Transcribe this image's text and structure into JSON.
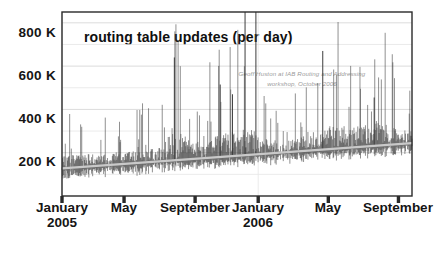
{
  "chart_data": {
    "type": "line",
    "render_style": "daily-spikes",
    "title": "routing table updates (per day)",
    "annotation": "Geoff Huston at IAB Routing and Addressing workshop, October 2006",
    "annotation_lines": [
      "Geoff Huston at IAB Routing and Addressing",
      "workshop, October 2006"
    ],
    "xlabel": "",
    "ylabel": "",
    "ylim": [
      0,
      850
    ],
    "y_unit": "K",
    "yticks": [
      200,
      400,
      600,
      800
    ],
    "ytick_labels": [
      "200 K",
      "400 K",
      "600 K",
      "800 K"
    ],
    "minor_gridlines": [
      100,
      300,
      500,
      700
    ],
    "grid": true,
    "legend": "none",
    "xlim_dates": [
      "2005-01-01",
      "2006-10-15"
    ],
    "xticks": [
      {
        "label": "January",
        "sublabel": "2005",
        "pos": 0.0
      },
      {
        "label": "May",
        "sublabel": "",
        "pos": 0.1773
      },
      {
        "label": "September",
        "sublabel": "",
        "pos": 0.3803
      },
      {
        "label": "January",
        "sublabel": "2006",
        "pos": 0.5606
      },
      {
        "label": "May",
        "sublabel": "",
        "pos": 0.7609
      },
      {
        "label": "September",
        "sublabel": "",
        "pos": 0.9613
      }
    ],
    "trend_line": {
      "description": "rising linear trend through the daily baseline",
      "start_value": 128,
      "end_value": 244,
      "color": "#c9c9c9"
    },
    "series_color": "#3c3c3c",
    "notable_spikes": [
      {
        "pos": 0.321,
        "value": 640
      },
      {
        "pos": 0.452,
        "value": 515
      },
      {
        "pos": 0.487,
        "value": 470
      },
      {
        "pos": 0.523,
        "value": 850
      },
      {
        "pos": 0.554,
        "value": 850
      },
      {
        "pos": 0.745,
        "value": 670
      },
      {
        "pos": 0.892,
        "value": 455
      }
    ],
    "baseline_range": [
      95,
      250
    ],
    "axis_color": "#2a2a2a",
    "grid_color": "#d8d8d8",
    "background": "#ffffff"
  },
  "plot_geometry": {
    "left": 62,
    "top": 12,
    "right": 412,
    "bottom": 196
  }
}
